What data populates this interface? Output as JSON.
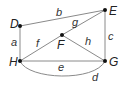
{
  "diagram": {
    "type": "graph",
    "nodes": [
      {
        "id": "D",
        "label": "D"
      },
      {
        "id": "E",
        "label": "E"
      },
      {
        "id": "F",
        "label": "F"
      },
      {
        "id": "G",
        "label": "G"
      },
      {
        "id": "H",
        "label": "H"
      }
    ],
    "edges": [
      {
        "label": "a",
        "from": "D",
        "to": "H"
      },
      {
        "label": "b",
        "from": "D",
        "to": "E"
      },
      {
        "label": "c",
        "from": "E",
        "to": "G"
      },
      {
        "label": "d",
        "from": "H",
        "to": "G",
        "curved": true
      },
      {
        "label": "e",
        "from": "H",
        "to": "G"
      },
      {
        "label": "f",
        "from": "H",
        "to": "F"
      },
      {
        "label": "g",
        "from": "F",
        "to": "E"
      },
      {
        "label": "h",
        "from": "F",
        "to": "G"
      }
    ],
    "colors": {
      "edge": "#8a8a8a",
      "node": "#111111",
      "text": "#222222"
    }
  }
}
